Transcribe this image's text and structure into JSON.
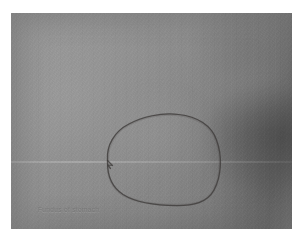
{
  "viewer": {
    "name": "grayscale-radiographic-image-viewer",
    "background_color": "#ffffff"
  },
  "image": {
    "alt_description": "Grayscale radiographic film with hand-drawn circular annotation",
    "modality_appearance": "grayscale fluoroscopy / x-ray film",
    "frame_border_color": "#ffffff",
    "base_tone": "#8a8a8a",
    "light_region_tone": "#a6a6a6",
    "dark_region_tone": "#5a5a5a",
    "regions": [
      {
        "label": "light-parenchyma-left",
        "tone": "#a2a2a2"
      },
      {
        "label": "dark-soft-tissue-right",
        "tone": "#5e5e5e"
      },
      {
        "label": "horizontal-scan-seam",
        "tone": "#b8b8b8"
      }
    ]
  },
  "annotation": {
    "type": "freehand-circle",
    "label": "region-of-interest-circle",
    "stroke_color": "#3d3b3a",
    "stroke_width": 1.25,
    "note": "hand-drawn closed loop with a pointed cusp at the left where the stroke overlaps"
  },
  "watermark": {
    "text": "Fundus of stomach",
    "color": "#767676"
  }
}
